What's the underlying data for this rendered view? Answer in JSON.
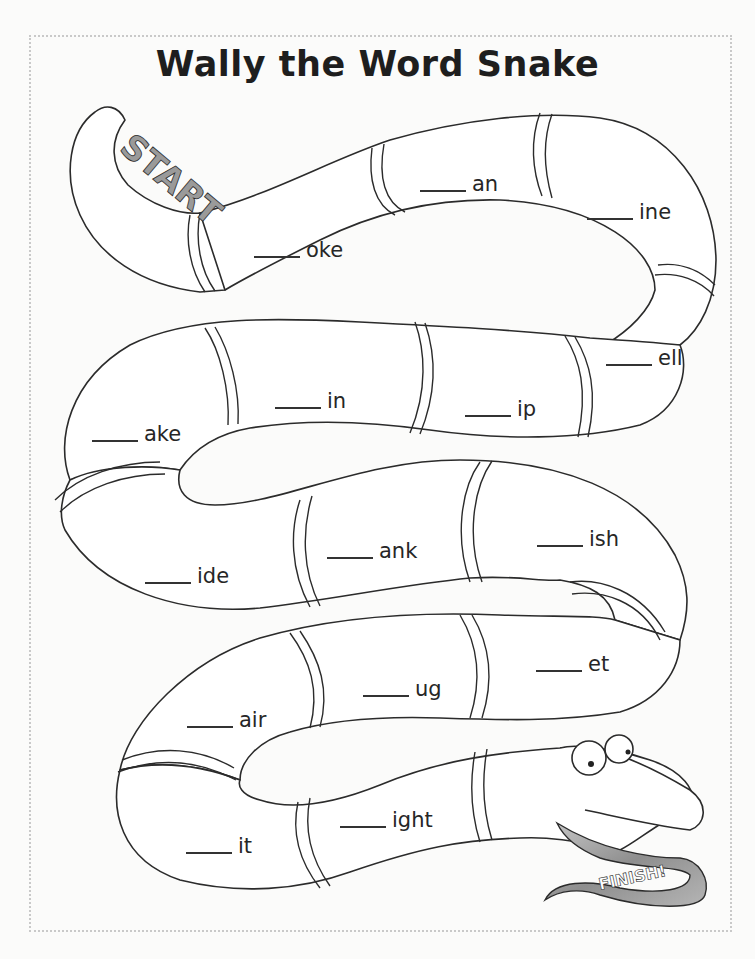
{
  "title": "Wally the Word Snake",
  "start_label": "START",
  "finish_label": "FINISH!",
  "segments": [
    {
      "ending": "oke",
      "x": 254,
      "y": 238
    },
    {
      "ending": "an",
      "x": 420,
      "y": 172
    },
    {
      "ending": "ine",
      "x": 587,
      "y": 200
    },
    {
      "ending": "ell",
      "x": 606,
      "y": 346
    },
    {
      "ending": "in",
      "x": 275,
      "y": 389
    },
    {
      "ending": "ip",
      "x": 465,
      "y": 397
    },
    {
      "ending": "ake",
      "x": 92,
      "y": 422
    },
    {
      "ending": "ish",
      "x": 537,
      "y": 527
    },
    {
      "ending": "ank",
      "x": 327,
      "y": 539
    },
    {
      "ending": "ide",
      "x": 145,
      "y": 564
    },
    {
      "ending": "et",
      "x": 536,
      "y": 652
    },
    {
      "ending": "ug",
      "x": 363,
      "y": 677
    },
    {
      "ending": "air",
      "x": 187,
      "y": 708
    },
    {
      "ending": "ight",
      "x": 340,
      "y": 808
    },
    {
      "ending": "it",
      "x": 186,
      "y": 834
    }
  ],
  "colors": {
    "outline": "#2b2b2b",
    "ribbon": "#9a9a9a",
    "background": "#fbfbfa",
    "border": "#c9c9c9"
  }
}
